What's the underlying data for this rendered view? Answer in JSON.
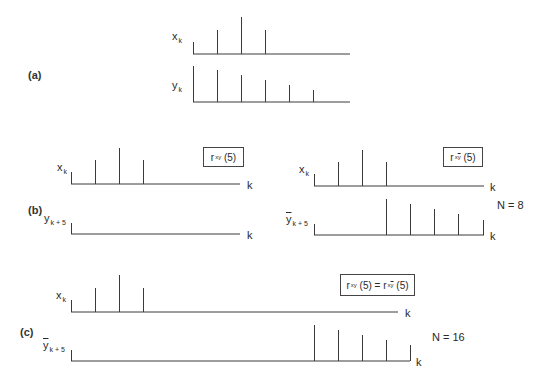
{
  "panels": {
    "a": {
      "label": "(a)",
      "x_label": "x",
      "x_sub": "k",
      "y_label": "y",
      "y_sub": "k"
    },
    "b": {
      "label": "(b)",
      "left": {
        "x_label": "x",
        "x_sub": "k",
        "y_label": "y",
        "y_sub": "k + 5",
        "axis_label": "k",
        "box": {
          "r": "r",
          "sub": "xy",
          "arg": "(5)"
        }
      },
      "right": {
        "x_label": "x",
        "x_sub": "k",
        "y_label": "y",
        "y_sub": "k + 5",
        "axis_label": "k",
        "box": {
          "r": "r",
          "sub_x": "x",
          "sub_y": "y",
          "arg": "(5)"
        },
        "n_label": "N = 8"
      }
    },
    "c": {
      "label": "(c)",
      "x_label": "x",
      "x_sub": "k",
      "y_label": "y",
      "y_sub": "k + 5",
      "axis_label": "k",
      "box": {
        "r1": "r",
        "sub1": "xy",
        "arg1": "(5)",
        "eq": " = ",
        "r2": "r",
        "sub2_x": "x",
        "sub2_y": "y",
        "arg2": "(5)"
      },
      "n_label": "N = 16"
    }
  },
  "chart_data": [
    {
      "type": "stem",
      "title": "(a) x_k",
      "baseline_y": 54,
      "x_start": 193,
      "x_end": 350,
      "stems": [
        {
          "x": 193,
          "top": 42
        },
        {
          "x": 217,
          "top": 30
        },
        {
          "x": 241,
          "top": 17
        },
        {
          "x": 265,
          "top": 30
        }
      ],
      "values": [
        1,
        2,
        3,
        2
      ]
    },
    {
      "type": "stem",
      "title": "(a) y_k",
      "baseline_y": 102,
      "x_start": 193,
      "x_end": 350,
      "stems": [
        {
          "x": 193,
          "top": 66
        },
        {
          "x": 217,
          "top": 70
        },
        {
          "x": 241,
          "top": 75
        },
        {
          "x": 265,
          "top": 80
        },
        {
          "x": 289,
          "top": 85
        },
        {
          "x": 313,
          "top": 90
        }
      ],
      "values": [
        3.0,
        2.7,
        2.3,
        1.8,
        1.4,
        1.0
      ]
    },
    {
      "type": "stem",
      "title": "(b) x_k (left)",
      "baseline_y": 184,
      "x_start": 71,
      "x_end": 240,
      "stems": [
        {
          "x": 71,
          "top": 172
        },
        {
          "x": 95,
          "top": 160
        },
        {
          "x": 119,
          "top": 148
        },
        {
          "x": 143,
          "top": 160
        }
      ],
      "values": [
        1,
        2,
        3,
        2
      ]
    },
    {
      "type": "stem",
      "title": "(b) y_{k+5} (left)",
      "baseline_y": 234,
      "x_start": 71,
      "x_end": 240,
      "stems": [
        {
          "x": 71,
          "top": 223
        }
      ],
      "values": []
    },
    {
      "type": "stem",
      "title": "(b) x_k (right)",
      "baseline_y": 186,
      "x_start": 314,
      "x_end": 484,
      "stems": [
        {
          "x": 314,
          "top": 174
        },
        {
          "x": 338,
          "top": 162
        },
        {
          "x": 362,
          "top": 150
        },
        {
          "x": 386,
          "top": 162
        }
      ],
      "values": [
        1,
        2,
        3,
        2
      ]
    },
    {
      "type": "stem",
      "title": "(b) ybar_{k+5} (right), N = 8",
      "baseline_y": 235,
      "x_start": 314,
      "x_end": 484,
      "stems": [
        {
          "x": 314,
          "top": 224
        },
        {
          "x": 386,
          "top": 199
        },
        {
          "x": 410,
          "top": 204
        },
        {
          "x": 434,
          "top": 209
        },
        {
          "x": 458,
          "top": 214
        },
        {
          "x": 483,
          "top": 220
        }
      ],
      "values": [
        3.0,
        2.7,
        2.3,
        1.8,
        1.4
      ]
    },
    {
      "type": "stem",
      "title": "(c) x_k",
      "baseline_y": 312,
      "x_start": 71,
      "x_end": 398,
      "stems": [
        {
          "x": 71,
          "top": 300
        },
        {
          "x": 95,
          "top": 288
        },
        {
          "x": 119,
          "top": 275
        },
        {
          "x": 143,
          "top": 288
        }
      ],
      "values": [
        1,
        2,
        3,
        2
      ]
    },
    {
      "type": "stem",
      "title": "(c) ybar_{k+5}, N = 16",
      "baseline_y": 361,
      "x_start": 71,
      "x_end": 410,
      "stems": [
        {
          "x": 71,
          "top": 350
        },
        {
          "x": 314,
          "top": 325
        },
        {
          "x": 338,
          "top": 330
        },
        {
          "x": 362,
          "top": 335
        },
        {
          "x": 386,
          "top": 340
        },
        {
          "x": 410,
          "top": 345
        }
      ],
      "values": [
        3.0,
        2.7,
        2.3,
        1.8,
        1.4
      ]
    }
  ]
}
